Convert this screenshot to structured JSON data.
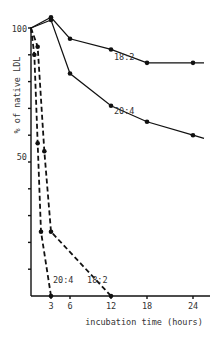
{
  "chart_data": {
    "type": "line",
    "title": "",
    "xlabel": "incubation time (hours)",
    "ylabel": "% of native LDL",
    "xlim": [
      0,
      25
    ],
    "ylim": [
      0,
      105
    ],
    "x_ticks": [
      3,
      6,
      12,
      18,
      24
    ],
    "y_ticks_labeled": [
      50,
      100
    ],
    "y_tick_step": 10,
    "grid": false,
    "legend": "inline labels",
    "series": [
      {
        "name": "18:2",
        "style": "solid",
        "x": [
          0,
          3,
          6,
          12,
          18,
          24
        ],
        "y": [
          100,
          104,
          96,
          92,
          87,
          87
        ],
        "label_at": [
          12.5,
          88
        ]
      },
      {
        "name": "20:4",
        "style": "solid",
        "x": [
          0,
          3,
          6,
          12,
          18,
          24
        ],
        "y": [
          100,
          103,
          83,
          71,
          65,
          60
        ],
        "label_at": [
          12.5,
          68
        ]
      },
      {
        "name": "18:2",
        "style": "dashed",
        "x": [
          0,
          1,
          2,
          3,
          12
        ],
        "y": [
          100,
          93,
          54,
          24,
          0
        ],
        "label_at": [
          8.5,
          5
        ]
      },
      {
        "name": "20:4",
        "style": "dashed",
        "x": [
          0,
          0.5,
          1,
          1.5,
          3
        ],
        "y": [
          100,
          90,
          57,
          24,
          0
        ],
        "label_at": [
          3.3,
          5
        ]
      }
    ]
  },
  "labels": {
    "x_title": "incubation time (hours)",
    "y_title": "% of native LDL",
    "y_100": "100",
    "y_50": "50",
    "x_3": "3",
    "x_6": "6",
    "x_12": "12",
    "x_18": "18",
    "x_24": "24"
  }
}
